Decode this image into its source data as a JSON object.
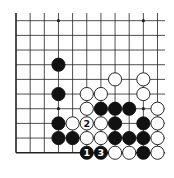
{
  "diagram": {
    "type": "go-board-fragment",
    "columns": 11,
    "rows": 10,
    "open_edges": [
      "top",
      "right"
    ],
    "closed_edges": [
      "left",
      "bottom"
    ],
    "star_points": [
      [
        3,
        0
      ],
      [
        9,
        0
      ],
      [
        3,
        6
      ],
      [
        9,
        6
      ]
    ],
    "stones": [
      {
        "col": 3,
        "row": 3,
        "color": "black"
      },
      {
        "col": 3,
        "row": 5,
        "color": "black"
      },
      {
        "col": 7,
        "row": 4,
        "color": "white"
      },
      {
        "col": 9,
        "row": 4,
        "color": "white"
      },
      {
        "col": 5,
        "row": 5,
        "color": "white"
      },
      {
        "col": 6,
        "row": 5,
        "color": "white"
      },
      {
        "col": 9,
        "row": 5,
        "color": "white"
      },
      {
        "col": 5,
        "row": 6,
        "color": "white"
      },
      {
        "col": 6,
        "row": 6,
        "color": "black"
      },
      {
        "col": 7,
        "row": 6,
        "color": "black"
      },
      {
        "col": 8,
        "row": 6,
        "color": "black"
      },
      {
        "col": 10,
        "row": 6,
        "color": "white"
      },
      {
        "col": 3,
        "row": 7,
        "color": "black"
      },
      {
        "col": 4,
        "row": 7,
        "color": "white"
      },
      {
        "col": 5,
        "row": 7,
        "color": "white",
        "label": "2"
      },
      {
        "col": 6,
        "row": 7,
        "color": "white"
      },
      {
        "col": 7,
        "row": 7,
        "color": "black"
      },
      {
        "col": 9,
        "row": 7,
        "color": "black"
      },
      {
        "col": 10,
        "row": 7,
        "color": "white"
      },
      {
        "col": 3,
        "row": 8,
        "color": "black"
      },
      {
        "col": 4,
        "row": 8,
        "color": "black"
      },
      {
        "col": 5,
        "row": 8,
        "color": "white"
      },
      {
        "col": 6,
        "row": 8,
        "color": "white"
      },
      {
        "col": 7,
        "row": 8,
        "color": "black"
      },
      {
        "col": 8,
        "row": 8,
        "color": "black"
      },
      {
        "col": 9,
        "row": 8,
        "color": "black"
      },
      {
        "col": 10,
        "row": 8,
        "color": "white"
      },
      {
        "col": 5,
        "row": 9,
        "color": "black",
        "label": "1"
      },
      {
        "col": 6,
        "row": 9,
        "color": "black",
        "label": "3"
      },
      {
        "col": 7,
        "row": 9,
        "color": "white"
      },
      {
        "col": 8,
        "row": 9,
        "color": "white"
      },
      {
        "col": 9,
        "row": 9,
        "color": "black"
      },
      {
        "col": 10,
        "row": 9,
        "color": "white"
      }
    ],
    "colors": {
      "line": "#222222",
      "black_stone": "#111111",
      "white_stone": "#ffffff",
      "background": "#ffffff"
    }
  }
}
